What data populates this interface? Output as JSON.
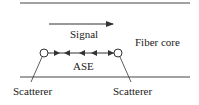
{
  "diagram": {
    "labels": {
      "signal": "Signal",
      "fiber_core": "Fiber core",
      "ase": "ASE",
      "scatterer_left": "Scatterer",
      "scatterer_right": "Scatterer"
    },
    "signal_direction": "right",
    "ase_arrow_directions": [
      "right",
      "left",
      "left",
      "left",
      "right"
    ],
    "colors": {
      "line": "#333333",
      "text": "#222222",
      "background": "#ffffff"
    }
  }
}
